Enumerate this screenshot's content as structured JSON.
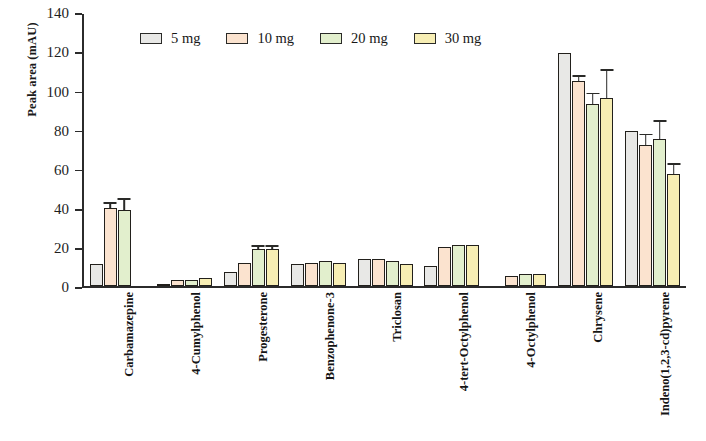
{
  "chart_data": {
    "type": "bar",
    "title": "",
    "xlabel": "",
    "ylabel": "Peak area (mAU)",
    "ylim": [
      0,
      140
    ],
    "yticks": [
      0,
      20,
      40,
      60,
      80,
      100,
      120,
      140
    ],
    "ytick_labels": [
      "0",
      "20",
      "40",
      "60",
      "80",
      "100",
      "120",
      "140"
    ],
    "grid": false,
    "legend_position": "top-center",
    "categories": [
      "Carbamazepine",
      "4-Cumylphenol",
      "Progesterone",
      "Benzophenone-3",
      "Triclosan",
      "4-tert-Octylphenol",
      "4-Octylphenol",
      "Chrysene",
      "Indeno(1,2,3-cd)pyrene"
    ],
    "series": [
      {
        "name": "5 mg",
        "color": "#e8e8e6",
        "values": [
          11,
          1,
          7,
          11,
          14,
          10,
          0,
          119,
          79
        ],
        "errors": [
          0,
          0,
          0,
          0,
          0,
          0,
          0,
          0,
          0
        ]
      },
      {
        "name": "10 mg",
        "color": "#fbe3cf",
        "values": [
          40,
          3,
          12,
          12,
          14,
          20,
          5,
          105,
          72
        ],
        "errors": [
          2,
          0,
          0,
          0,
          0,
          0,
          0,
          2,
          5
        ]
      },
      {
        "name": "20 mg",
        "color": "#e2efcd",
        "values": [
          39,
          3,
          19,
          13,
          13,
          21,
          6,
          93,
          75
        ],
        "errors": [
          5,
          0,
          1,
          0,
          0,
          0,
          0,
          5,
          9
        ]
      },
      {
        "name": "30 mg",
        "color": "#f7eeb4",
        "values": [
          0,
          4,
          19,
          12,
          11,
          21,
          6,
          96,
          57
        ],
        "errors": [
          0,
          0,
          1,
          0,
          0,
          0,
          0,
          14,
          5
        ]
      }
    ]
  }
}
